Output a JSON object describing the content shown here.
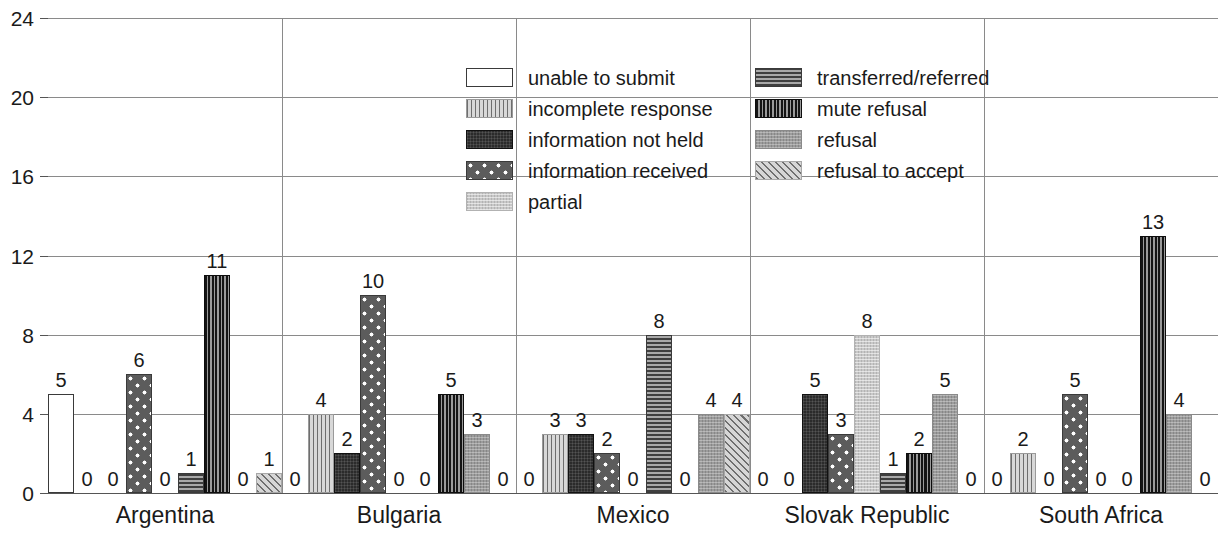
{
  "chart_data": {
    "type": "bar",
    "title": "",
    "subtitle": "",
    "xlabel": "",
    "ylabel": "",
    "ylim": [
      0,
      24
    ],
    "yticks": [
      0,
      4,
      8,
      12,
      16,
      20,
      24
    ],
    "grid": true,
    "legend_position": "inside-top-center",
    "grouping": "grouped",
    "show_value_labels": true,
    "categories": [
      "Argentina",
      "Bulgaria",
      "Mexico",
      "Slovak Republic",
      "South Africa"
    ],
    "series": [
      {
        "name": "unable to submit",
        "pattern": "empty-white",
        "values": [
          5,
          0,
          0,
          0,
          0
        ]
      },
      {
        "name": "incomplete response",
        "pattern": "vertical-stripes-light",
        "values": [
          0,
          4,
          3,
          0,
          2
        ]
      },
      {
        "name": "information not held",
        "pattern": "solid-dark",
        "values": [
          0,
          2,
          3,
          5,
          0
        ]
      },
      {
        "name": "information received",
        "pattern": "dark-white-dots",
        "values": [
          6,
          10,
          2,
          3,
          5
        ]
      },
      {
        "name": "partial",
        "pattern": "light-gray",
        "values": [
          0,
          0,
          0,
          8,
          0
        ]
      },
      {
        "name": "transferred/referred",
        "pattern": "horizontal-lines",
        "values": [
          1,
          0,
          8,
          1,
          0
        ]
      },
      {
        "name": "mute refusal",
        "pattern": "vertical-stripes-dark",
        "values": [
          11,
          5,
          0,
          2,
          13
        ]
      },
      {
        "name": "refusal",
        "pattern": "medium-gray",
        "values": [
          0,
          3,
          4,
          5,
          4
        ]
      },
      {
        "name": "refusal to accept",
        "pattern": "diagonal-hatch",
        "values": [
          1,
          0,
          4,
          0,
          0
        ]
      }
    ]
  },
  "legend": {
    "left_column": [
      "unable to submit",
      "incomplete response",
      "information not held",
      "information received",
      "partial"
    ],
    "right_column": [
      "transferred/referred",
      "mute refusal",
      "refusal",
      "refusal to accept"
    ]
  },
  "colors": {
    "gridline": "#8a8a8a",
    "axis": "#555555",
    "text": "#1a1a1a",
    "background": "#ffffff"
  }
}
